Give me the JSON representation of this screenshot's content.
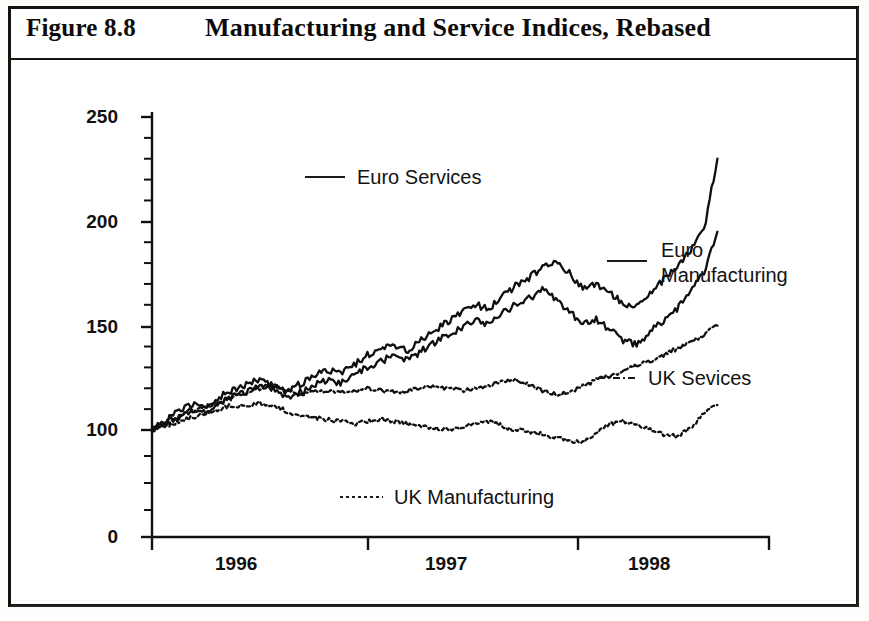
{
  "figure": {
    "number": "Figure 8.8",
    "title": "Manufacturing and Service Indices, Rebased"
  },
  "chart_data": {
    "type": "line",
    "title": "Manufacturing and Service Indices, Rebased",
    "xlabel": "",
    "ylabel": "",
    "grid": false,
    "legend_position": "inside-annotations",
    "ylim": [
      0,
      250
    ],
    "y_ticks": [
      0,
      100,
      150,
      200,
      250
    ],
    "y_minor_tick_step": 10,
    "y_axis_note": "broken axis: 0 then 100 upward in equal 50-unit steps",
    "x_tick_labels": [
      "1996",
      "1997",
      "1998"
    ],
    "x_tick_boundaries": [
      "1995.75",
      "1996.75",
      "1997.75",
      "1998.5"
    ],
    "xlim": [
      1995.75,
      1998.5
    ],
    "colors": {
      "line": "#101010",
      "axis": "#111111",
      "background": "#ffffff"
    },
    "series": [
      {
        "name": "Euro Services",
        "style": "solid",
        "label_position": "upper-left",
        "x": [
          1995.75,
          1995.81,
          1995.87,
          1995.93,
          1995.99,
          1996.05,
          1996.11,
          1996.17,
          1996.23,
          1996.29,
          1996.35,
          1996.41,
          1996.47,
          1996.53,
          1996.59,
          1996.65,
          1996.71,
          1996.77,
          1996.83,
          1996.89,
          1996.95,
          1997.01,
          1997.07,
          1997.13,
          1997.19,
          1997.25,
          1997.31,
          1997.37,
          1997.43,
          1997.49,
          1997.55,
          1997.61,
          1997.67,
          1997.73,
          1997.79,
          1997.85,
          1997.91,
          1997.97,
          1998.03,
          1998.09,
          1998.15,
          1998.21,
          1998.27
        ],
        "values": [
          100,
          104,
          109,
          112,
          110,
          116,
          119,
          122,
          124,
          121,
          118,
          122,
          126,
          129,
          127,
          131,
          136,
          139,
          141,
          138,
          143,
          148,
          152,
          156,
          160,
          158,
          164,
          169,
          173,
          178,
          181,
          175,
          168,
          170,
          166,
          161,
          159,
          166,
          172,
          178,
          186,
          196,
          230
        ]
      },
      {
        "name": "Euro Manufacturing",
        "style": "solid",
        "label_position": "right",
        "x": [
          1995.75,
          1995.81,
          1995.87,
          1995.93,
          1995.99,
          1996.05,
          1996.11,
          1996.17,
          1996.23,
          1996.29,
          1996.35,
          1996.41,
          1996.47,
          1996.53,
          1996.59,
          1996.65,
          1996.71,
          1996.77,
          1996.83,
          1996.89,
          1996.95,
          1997.01,
          1997.07,
          1997.13,
          1997.19,
          1997.25,
          1997.31,
          1997.37,
          1997.43,
          1997.49,
          1997.55,
          1997.61,
          1997.67,
          1997.73,
          1997.79,
          1997.85,
          1997.91,
          1997.97,
          1998.03,
          1998.09,
          1998.15,
          1998.21,
          1998.27
        ],
        "values": [
          100,
          103,
          107,
          110,
          108,
          113,
          116,
          118,
          121,
          119,
          115,
          118,
          121,
          124,
          122,
          126,
          130,
          133,
          136,
          133,
          138,
          142,
          146,
          149,
          153,
          150,
          156,
          160,
          163,
          167,
          163,
          157,
          150,
          153,
          148,
          143,
          141,
          147,
          152,
          158,
          166,
          176,
          195
        ]
      },
      {
        "name": "UK Sevices",
        "style": "dash-dot",
        "label_position": "right",
        "x": [
          1995.75,
          1995.81,
          1995.87,
          1995.93,
          1995.99,
          1996.05,
          1996.11,
          1996.17,
          1996.23,
          1996.29,
          1996.35,
          1996.41,
          1996.47,
          1996.53,
          1996.59,
          1996.65,
          1996.71,
          1996.77,
          1996.83,
          1996.89,
          1996.95,
          1997.01,
          1997.07,
          1997.13,
          1997.19,
          1997.25,
          1997.31,
          1997.37,
          1997.43,
          1997.49,
          1997.55,
          1997.61,
          1997.67,
          1997.73,
          1997.79,
          1997.85,
          1997.91,
          1997.97,
          1998.03,
          1998.09,
          1998.15,
          1998.21,
          1998.27
        ],
        "values": [
          100,
          103,
          106,
          109,
          111,
          113,
          116,
          118,
          120,
          122,
          119,
          117,
          118,
          119,
          118,
          119,
          120,
          119,
          118,
          119,
          120,
          121,
          120,
          119,
          120,
          121,
          123,
          124,
          122,
          119,
          117,
          118,
          121,
          124,
          126,
          128,
          131,
          133,
          136,
          139,
          142,
          146,
          150
        ]
      },
      {
        "name": "UK Manufacturing",
        "style": "dotted",
        "label_position": "lower-left",
        "x": [
          1995.75,
          1995.81,
          1995.87,
          1995.93,
          1995.99,
          1996.05,
          1996.11,
          1996.17,
          1996.23,
          1996.29,
          1996.35,
          1996.41,
          1996.47,
          1996.53,
          1996.59,
          1996.65,
          1996.71,
          1996.77,
          1996.83,
          1996.89,
          1996.95,
          1997.01,
          1997.07,
          1997.13,
          1997.19,
          1997.25,
          1997.31,
          1997.37,
          1997.43,
          1997.49,
          1997.55,
          1997.61,
          1997.67,
          1997.73,
          1997.79,
          1997.85,
          1997.91,
          1997.97,
          1998.03,
          1998.09,
          1998.15,
          1998.21,
          1998.27
        ],
        "values": [
          100,
          102,
          104,
          106,
          108,
          110,
          112,
          111,
          113,
          112,
          109,
          107,
          106,
          105,
          104,
          103,
          104,
          105,
          104,
          103,
          102,
          101,
          100,
          101,
          103,
          104,
          102,
          100,
          99,
          98,
          96,
          95,
          94,
          99,
          103,
          104,
          102,
          100,
          98,
          97,
          101,
          108,
          112
        ]
      }
    ]
  },
  "axes": {
    "y_ticks": [
      {
        "label": "250",
        "value": 250
      },
      {
        "label": "200",
        "value": 200
      },
      {
        "label": "150",
        "value": 150
      },
      {
        "label": "100",
        "value": 100
      },
      {
        "label": "0",
        "value": 0
      }
    ],
    "x_ticks": [
      {
        "label": "1996"
      },
      {
        "label": "1997"
      },
      {
        "label": "1998"
      }
    ]
  },
  "legend": [
    {
      "key": "euro_services",
      "label": "Euro Services",
      "style": "solid"
    },
    {
      "key": "euro_manufacturing",
      "label_line1": "Euro",
      "label_line2": "Manufacturing",
      "style": "solid"
    },
    {
      "key": "uk_services",
      "label": "UK Sevices",
      "style": "dash-dot"
    },
    {
      "key": "uk_manufacturing",
      "label": "UK Manufacturing",
      "style": "dotted"
    }
  ]
}
